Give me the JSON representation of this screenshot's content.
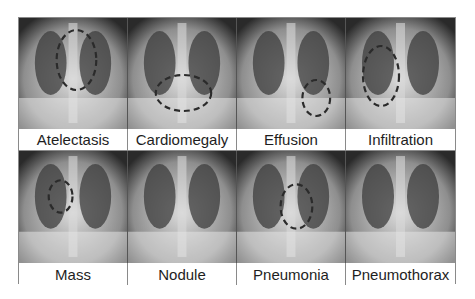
{
  "figure": {
    "rows": [
      {
        "cells": [
          {
            "label": "Atelectasis",
            "tone": "#8e8e8e",
            "circle": {
              "cx": 58,
              "cy": 42,
              "rx": 20,
              "ry": 30
            }
          },
          {
            "label": "Cardiomegaly",
            "tone": "#a2a2a2",
            "circle": {
              "cx": 56,
              "cy": 75,
              "rx": 28,
              "ry": 18
            }
          },
          {
            "label": "Effusion",
            "tone": "#9a9a9a",
            "circle": {
              "cx": 80,
              "cy": 80,
              "rx": 14,
              "ry": 18
            }
          },
          {
            "label": "Infiltration",
            "tone": "#7a7a7a",
            "circle": {
              "cx": 35,
              "cy": 58,
              "rx": 18,
              "ry": 30
            }
          }
        ]
      },
      {
        "cells": [
          {
            "label": "Mass",
            "tone": "#9c9c9c",
            "circle": {
              "cx": 42,
              "cy": 45,
              "rx": 12,
              "ry": 16
            }
          },
          {
            "label": "Nodule",
            "tone": "#8c8c8c",
            "circle": null
          },
          {
            "label": "Pneumonia",
            "tone": "#969696",
            "circle": {
              "cx": 60,
              "cy": 55,
              "rx": 16,
              "ry": 22
            }
          },
          {
            "label": "Pneumothorax",
            "tone": "#7c7c7c",
            "circle": null
          }
        ]
      }
    ]
  }
}
